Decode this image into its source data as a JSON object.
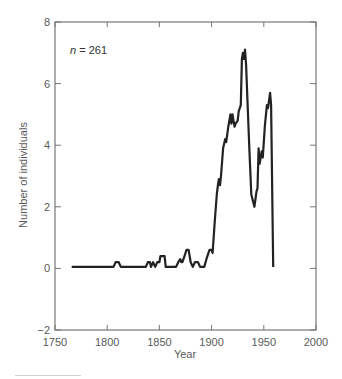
{
  "chart_data": {
    "type": "line",
    "title": "",
    "xlabel": "Year",
    "ylabel": "Number of individuals",
    "annotation": {
      "italic": "n",
      "text": " = 261"
    },
    "xlim": [
      1750,
      2000
    ],
    "ylim": [
      -2,
      8
    ],
    "x_ticks": [
      1750,
      1800,
      1850,
      1900,
      1950,
      2000
    ],
    "y_ticks": [
      -2,
      0,
      2,
      4,
      6,
      8
    ],
    "x_tick_labels": [
      "1750",
      "1800",
      "1850",
      "1900",
      "1950",
      "2000"
    ],
    "y_tick_labels": [
      "−2",
      "0",
      "2",
      "4",
      "6",
      "8"
    ],
    "grid": false,
    "legend": null,
    "series": [
      {
        "name": "Number of individuals",
        "color": "#222222",
        "x": [
          1766,
          1806,
          1808,
          1811,
          1813,
          1837,
          1839,
          1841,
          1842,
          1844,
          1846,
          1848,
          1850,
          1851,
          1853,
          1855,
          1856,
          1866,
          1868,
          1870,
          1871,
          1872,
          1874,
          1876,
          1878,
          1880,
          1882,
          1884,
          1887,
          1889,
          1893,
          1895,
          1898,
          1900,
          1901,
          1903,
          1905,
          1906,
          1907,
          1908,
          1909,
          1911,
          1913,
          1914,
          1916,
          1918,
          1919,
          1920,
          1921,
          1922,
          1923,
          1925,
          1926,
          1928,
          1929,
          1930,
          1931,
          1932,
          1933,
          1936,
          1938,
          1941,
          1943,
          1944,
          1945,
          1946,
          1947,
          1948,
          1949,
          1951,
          1953,
          1954,
          1956,
          1957,
          1959
        ],
        "values": [
          0.05,
          0.05,
          0.2,
          0.2,
          0.05,
          0.05,
          0.2,
          0.2,
          0.05,
          0.2,
          0.05,
          0.2,
          0.2,
          0.4,
          0.4,
          0.4,
          0.05,
          0.05,
          0.2,
          0.3,
          0.2,
          0.2,
          0.4,
          0.6,
          0.6,
          0.2,
          0.05,
          0.2,
          0.2,
          0.05,
          0.05,
          0.3,
          0.6,
          0.6,
          0.5,
          1.5,
          2.4,
          2.7,
          2.9,
          2.7,
          3.0,
          3.9,
          4.2,
          4.1,
          4.6,
          5.0,
          4.7,
          5.0,
          4.8,
          4.6,
          4.7,
          4.8,
          5.1,
          5.3,
          6.8,
          7.0,
          6.8,
          7.1,
          6.6,
          4.0,
          2.4,
          2.0,
          2.5,
          2.6,
          3.9,
          3.4,
          3.6,
          3.8,
          3.6,
          4.6,
          5.3,
          5.2,
          5.7,
          5.3,
          0.05
        ]
      }
    ]
  }
}
